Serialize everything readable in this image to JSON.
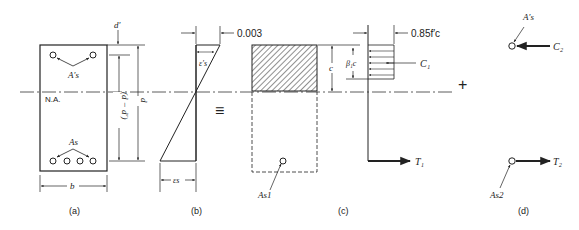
{
  "figure": {
    "panels": [
      {
        "id": "a",
        "caption": "(a)",
        "description": "Doubly reinforced beam cross-section"
      },
      {
        "id": "b",
        "caption": "(b)",
        "description": "Strain distribution"
      },
      {
        "id": "c",
        "caption": "(c)",
        "description": "Concrete compression block and tension steel As1"
      },
      {
        "id": "d",
        "caption": "(d)",
        "description": "Compression steel couple"
      }
    ],
    "labels": {
      "neutral_axis": "N.A.",
      "d_prime": "d′",
      "d": "d",
      "d_minus_d_prime": "(d − d′)",
      "b": "b",
      "As_prime": "A′s",
      "As": "As",
      "eps_s_prime": "ε′s",
      "eps_s": "εs",
      "strain_003": "0.003",
      "equiv": "≡",
      "c": "c",
      "beta1c": "β₁c",
      "stress": "0.85f′c",
      "C1": "C₁",
      "T1": "T₁",
      "As1": "As1",
      "plus": "+",
      "As_prime_d": "A′s",
      "C2": "C₂",
      "As2": "As2",
      "T2": "T₂"
    },
    "colors": {
      "ink": "#222222",
      "background": "#ffffff"
    }
  }
}
